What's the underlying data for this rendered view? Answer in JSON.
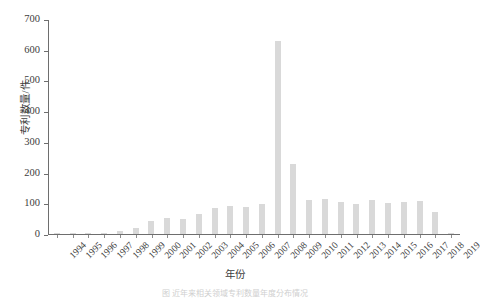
{
  "chart_data": {
    "type": "bar",
    "title": "",
    "xlabel": "年份",
    "ylabel": "专利数量/件",
    "ylim": [
      0,
      700
    ],
    "yticks": [
      0,
      100,
      200,
      300,
      400,
      500,
      600,
      700
    ],
    "grid": false,
    "legend": null,
    "bar_color": "#d9d9d9",
    "axis_color": "#6e6e6e",
    "categories": [
      "1994",
      "1995",
      "1996",
      "1997",
      "1998",
      "1999",
      "2000",
      "2001",
      "2002",
      "2003",
      "2004",
      "2005",
      "2006",
      "2007",
      "2008",
      "2009",
      "2010",
      "2011",
      "2012",
      "2013",
      "2014",
      "2015",
      "2016",
      "2017",
      "2018",
      "2019"
    ],
    "values": [
      1,
      1,
      1,
      2,
      10,
      20,
      41,
      53,
      50,
      66,
      85,
      92,
      88,
      97,
      630,
      230,
      112,
      116,
      106,
      97,
      110,
      103,
      104,
      107,
      72,
      3
    ]
  },
  "caption": {
    "text": "图 近年来相关领域专利数量年度分布情况"
  }
}
